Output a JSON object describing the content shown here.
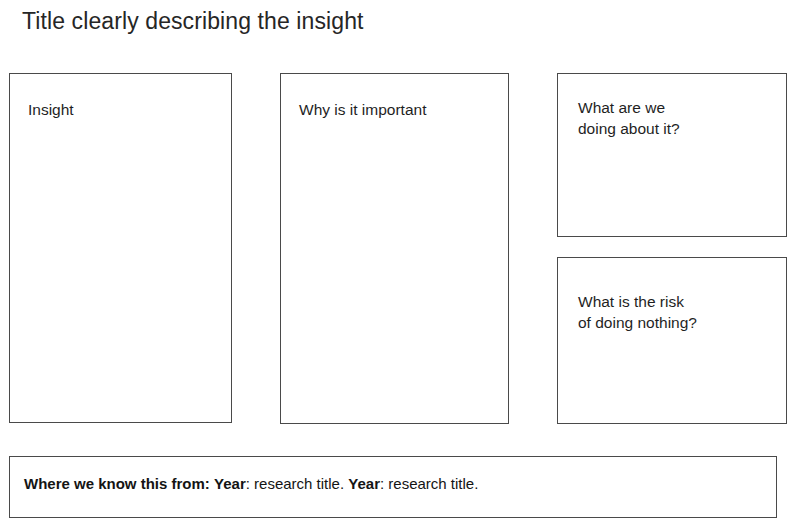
{
  "slide": {
    "title": "Title clearly describing the insight",
    "panels": [
      {
        "id": "insight",
        "label": "Insight"
      },
      {
        "id": "why-important",
        "label": "Why is it important"
      },
      {
        "id": "doing-about-it",
        "label": "What are we\ndoing about it?"
      },
      {
        "id": "risk-of-nothing",
        "label": "What is the risk\nof doing nothing?"
      }
    ],
    "sources": {
      "heading": "Where we know this from:",
      "entries": [
        {
          "year_label": "Year",
          "separator": ":",
          "title": " research title."
        },
        {
          "year_label": "Year",
          "separator": ":",
          "title": " research title."
        }
      ],
      "spacer": " "
    },
    "colors": {
      "background": "#ffffff",
      "border": "#4a4a4a",
      "text": "#1a1a1a"
    }
  }
}
